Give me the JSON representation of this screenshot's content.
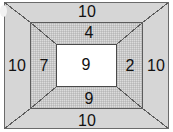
{
  "diagram": {
    "colors": {
      "outer_band_fill": "#d6d6d6",
      "middle_band_fill": "#dcdcdc",
      "inner_core_fill": "#ffffff",
      "line_color": "#5c5c5c",
      "text_color": "#111111",
      "page_background": "#ffffff"
    },
    "outer_band": {
      "top_label": "10",
      "bottom_label": "10",
      "left_label": "10",
      "right_label": "10"
    },
    "middle_band": {
      "top_label": "4",
      "bottom_label": "9",
      "left_label": "7",
      "right_label": "2"
    },
    "inner_core": {
      "label": "9"
    }
  }
}
